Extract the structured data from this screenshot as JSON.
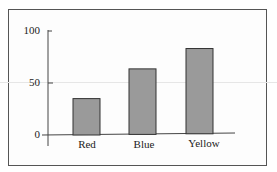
{
  "chart_data": {
    "type": "bar",
    "title": "",
    "xlabel": "",
    "ylabel": "",
    "categories": [
      "Red",
      "Blue",
      "Yellow"
    ],
    "values": [
      35,
      63,
      82
    ],
    "ylim": [
      0,
      100
    ],
    "yticks": [
      "0",
      "50",
      "100"
    ],
    "grid": false,
    "legend": null,
    "bar_color": "#9a9a9a"
  }
}
